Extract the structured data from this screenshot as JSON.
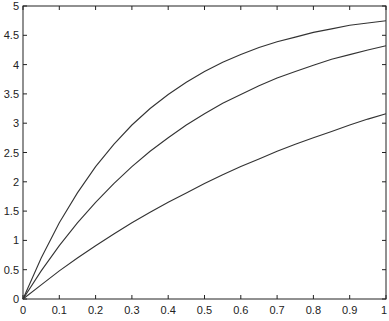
{
  "chart_data": {
    "type": "line",
    "title": "",
    "xlabel": "",
    "ylabel": "",
    "xlim": [
      0,
      1
    ],
    "ylim": [
      0,
      5
    ],
    "grid": false,
    "legend": null,
    "x_ticks": [
      "0",
      "0.1",
      "0.2",
      "0.3",
      "0.4",
      "0.5",
      "0.6",
      "0.7",
      "0.8",
      "0.9",
      "1"
    ],
    "y_ticks": [
      "0",
      "0.5",
      "1",
      "1.5",
      "2",
      "2.5",
      "3",
      "3.5",
      "4",
      "4.5",
      "5"
    ],
    "x": [
      0,
      0.05,
      0.1,
      0.15,
      0.2,
      0.25,
      0.3,
      0.35,
      0.4,
      0.45,
      0.5,
      0.55,
      0.6,
      0.65,
      0.7,
      0.75,
      0.8,
      0.85,
      0.9,
      0.95,
      1.0
    ],
    "series": [
      {
        "name": "upper",
        "color": "#333333",
        "values": [
          0,
          0.7,
          1.3,
          1.81,
          2.26,
          2.64,
          2.97,
          3.25,
          3.49,
          3.7,
          3.88,
          4.04,
          4.17,
          4.29,
          4.39,
          4.47,
          4.55,
          4.61,
          4.67,
          4.71,
          4.75
        ]
      },
      {
        "name": "middle",
        "color": "#333333",
        "values": [
          0,
          0.48,
          0.91,
          1.3,
          1.65,
          1.97,
          2.26,
          2.52,
          2.75,
          2.97,
          3.16,
          3.34,
          3.49,
          3.64,
          3.77,
          3.88,
          3.99,
          4.09,
          4.17,
          4.25,
          4.32
        ]
      },
      {
        "name": "lower",
        "color": "#333333",
        "values": [
          0,
          0.24,
          0.48,
          0.7,
          0.91,
          1.11,
          1.3,
          1.48,
          1.65,
          1.81,
          1.97,
          2.12,
          2.26,
          2.39,
          2.52,
          2.64,
          2.75,
          2.86,
          2.97,
          3.07,
          3.16
        ]
      }
    ]
  }
}
